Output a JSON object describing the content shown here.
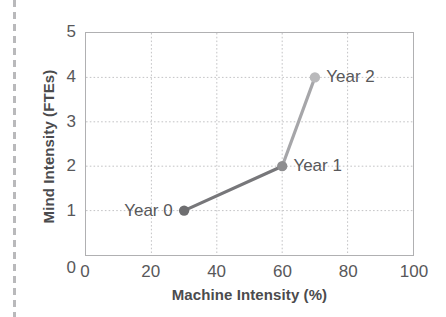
{
  "chart_data": {
    "type": "line",
    "title": "",
    "xlabel": "Machine Intensity (%)",
    "ylabel": "Mind Intensity (FTEs)",
    "xlim": [
      0,
      100
    ],
    "ylim": [
      0,
      5
    ],
    "xticks": [
      "0",
      "20",
      "40",
      "60",
      "80",
      "100"
    ],
    "xtick_values": [
      0,
      20,
      40,
      60,
      80,
      100
    ],
    "yticks": [
      "0",
      "1",
      "2",
      "3",
      "4",
      "5"
    ],
    "ytick_values": [
      0,
      1,
      2,
      3,
      4,
      5
    ],
    "grid": "dotted gridlines at x=20,40,60,80 and y=1,2,3,4",
    "legend": "none",
    "series": [
      {
        "name": "Mind vs Machine Intensity trajectory",
        "x": [
          30,
          60,
          70
        ],
        "y": [
          1,
          2,
          4
        ],
        "point_labels": [
          "Year 0",
          "Year 1",
          "Year 2"
        ],
        "label_positions": [
          "left",
          "right",
          "right"
        ],
        "marker_colors": [
          "#6e6e70",
          "#8e8e90",
          "#b9b9bb"
        ],
        "line_colors": [
          "#77777a",
          "#a6a6a9"
        ]
      }
    ],
    "colors": {
      "axis": "#b0b0b2",
      "grid": "#c3c3c5",
      "text": "#58585a",
      "title_text": "#4b4b4d",
      "edge_rule": "#b9b9bb"
    }
  },
  "decoration": {
    "edge_rule_name": "left-dashed-page-rule"
  }
}
